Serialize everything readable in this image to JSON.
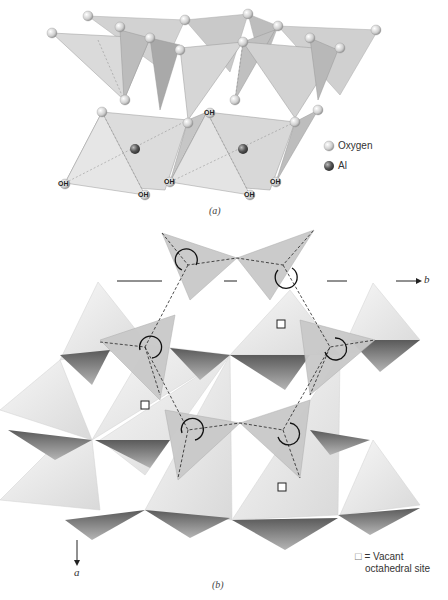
{
  "figure_a": {
    "caption": "(a)",
    "legend": [
      {
        "label": "Oxygen",
        "color": "#d8d8d8"
      },
      {
        "label": "Al",
        "color": "#6a6a6a"
      }
    ],
    "oh_label": "OH"
  },
  "figure_b": {
    "caption": "(b)",
    "axis_b_label": "b",
    "axis_a_label": "a",
    "vacant_legend": {
      "symbol": "□",
      "line1": "= Vacant",
      "line2": "octahedral site"
    }
  },
  "colors": {
    "face_light": "#e6e6e6",
    "face_mid": "#c8c8c8",
    "face_dark": "#8a8a8a",
    "tetra_fill": "#cfcfcf",
    "line": "#333333"
  }
}
